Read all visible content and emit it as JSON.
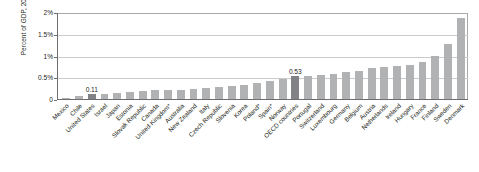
{
  "chart_data": {
    "type": "bar",
    "title": "",
    "xlabel": "",
    "ylabel": "Percent of GDP, 2014",
    "ylim": [
      0,
      2
    ],
    "ytick_labels": [
      "0",
      "0.5%",
      "1%",
      "1.5%",
      "2%"
    ],
    "ytick_values": [
      0,
      0.5,
      1,
      1.5,
      2
    ],
    "grid": true,
    "legend": "none",
    "bar_color": "#b0b2b4",
    "highlight_color": "#808285",
    "categories": [
      "Mexico",
      "Chile",
      "United States",
      "Israel",
      "Japan",
      "Estonia",
      "Slovak Republic",
      "Canada",
      "United Kingdom*",
      "Australia",
      "New Zealand",
      "Italy",
      "Czech Republic",
      "Slovenia",
      "Korea",
      "Poland*",
      "Spain*",
      "Norway",
      "OECD countries",
      "Portugal",
      "Switzerland",
      "Luxembourg",
      "Germany",
      "Belgium",
      "Austria",
      "Netherlands",
      "Ireland",
      "Hungary",
      "France",
      "Finland",
      "Sweden",
      "Denmark"
    ],
    "values": [
      0.03,
      0.07,
      0.11,
      0.12,
      0.14,
      0.17,
      0.18,
      0.2,
      0.21,
      0.22,
      0.24,
      0.26,
      0.28,
      0.3,
      0.33,
      0.38,
      0.41,
      0.47,
      0.53,
      0.53,
      0.56,
      0.58,
      0.62,
      0.66,
      0.71,
      0.74,
      0.76,
      0.78,
      0.86,
      1.0,
      1.28,
      1.88
    ],
    "highlighted": [
      "United States",
      "OECD countries"
    ],
    "data_labels": {
      "United States": "0.11",
      "OECD countries": "0.53"
    }
  }
}
